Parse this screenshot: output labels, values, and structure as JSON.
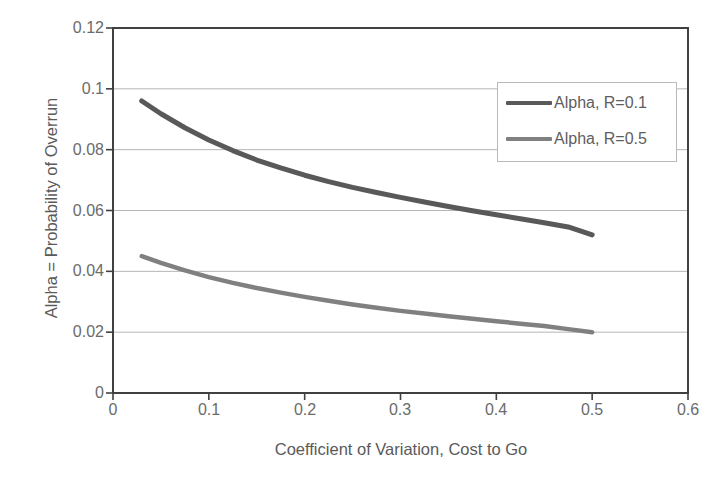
{
  "chart_data": {
    "type": "line",
    "title": "",
    "xlabel": "Coefficient of Variation, Cost to Go",
    "ylabel": "Alpha = Probability of Overrun",
    "xlim": [
      0,
      0.6
    ],
    "ylim": [
      0,
      0.12
    ],
    "xticks": [
      "0",
      "0.1",
      "0.2",
      "0.3",
      "0.4",
      "0.5",
      "0.6"
    ],
    "xtick_values": [
      0,
      0.1,
      0.2,
      0.3,
      0.4,
      0.5,
      0.6
    ],
    "yticks": [
      "0",
      "0.02",
      "0.04",
      "0.06",
      "0.08",
      "0.1",
      "0.12"
    ],
    "ytick_values": [
      0,
      0.02,
      0.04,
      0.06,
      0.08,
      0.1,
      0.12
    ],
    "grid": "horizontal",
    "legend_position": "upper right",
    "x": [
      0.03,
      0.05,
      0.075,
      0.1,
      0.125,
      0.15,
      0.175,
      0.2,
      0.225,
      0.25,
      0.275,
      0.3,
      0.325,
      0.35,
      0.375,
      0.4,
      0.425,
      0.45,
      0.475,
      0.5
    ],
    "series": [
      {
        "name": "Alpha, R=0.1",
        "color": "#595959",
        "values": [
          0.096,
          0.0918,
          0.0872,
          0.0832,
          0.0797,
          0.0766,
          0.074,
          0.0716,
          0.0695,
          0.0676,
          0.0659,
          0.0643,
          0.0628,
          0.0613,
          0.0599,
          0.0586,
          0.0573,
          0.056,
          0.0546,
          0.052
        ]
      },
      {
        "name": "Alpha, R=0.5",
        "color": "#808080",
        "values": [
          0.045,
          0.0428,
          0.0403,
          0.0381,
          0.0362,
          0.0345,
          0.033,
          0.0316,
          0.0303,
          0.0291,
          0.028,
          0.027,
          0.0261,
          0.0252,
          0.0244,
          0.0236,
          0.0228,
          0.022,
          0.021,
          0.02
        ]
      }
    ]
  },
  "legend": {
    "items": [
      {
        "label": "Alpha, R=0.1"
      },
      {
        "label": "Alpha, R=0.5"
      }
    ]
  },
  "style": {
    "axis_color": "#404040",
    "grid_color": "#b5b5b5",
    "plot_background": "#ffffff",
    "tick_label_color": "#6b6b6b"
  }
}
